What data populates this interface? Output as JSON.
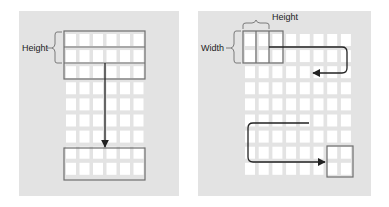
{
  "colors": {
    "background": "#ffffff",
    "panel": "#e3e3e3",
    "cell": "#ffffff",
    "box_stroke": "#6e6e6e",
    "arrow": "#222222",
    "bracket": "#7a7a7a"
  },
  "left_panel": {
    "label_height": "Height",
    "grid": {
      "columns": 6,
      "rows": 9
    },
    "source_box": {
      "rows": 3,
      "columns": 6,
      "description": "kernel of full-width rows"
    },
    "target_box": {
      "rows": 2,
      "columns": 6
    },
    "arrow_direction": "down"
  },
  "right_panel": {
    "label_width": "Width",
    "label_height": "Height",
    "grid": {
      "columns": 8,
      "rows": 9
    },
    "source_box": {
      "rows": 2,
      "columns": 3
    },
    "target_box": {
      "rows": 2,
      "columns": 2
    },
    "arrow_path": "raster scan: right, then wrap back left, continue down to bottom-right"
  }
}
